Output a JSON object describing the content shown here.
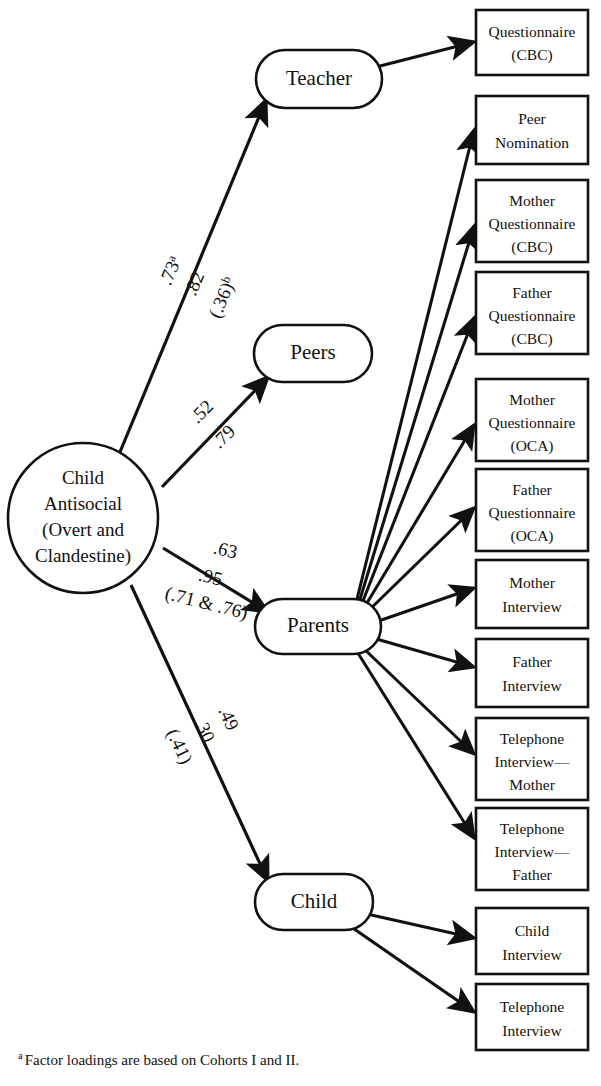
{
  "figure": {
    "latent_root": {
      "name": "child-antisocial",
      "lines": [
        "Child",
        "Antisocial",
        "(Overt and",
        "Clandestine)"
      ]
    },
    "latent_factors": [
      {
        "id": "teacher",
        "label": "Teacher"
      },
      {
        "id": "peers",
        "label": "Peers"
      },
      {
        "id": "parents",
        "label": "Parents"
      },
      {
        "id": "child",
        "label": "Child"
      }
    ],
    "paths": [
      {
        "id": "root-to-teacher",
        "from": "Child Antisocial (Overt and Clandestine)",
        "to": "Teacher",
        "coefficients": [
          "1.73",
          ".82",
          "(.36)"
        ],
        "labels": [
          {
            "text": ".73",
            "sup": "a"
          },
          {
            "text": ".82",
            "sup": ""
          },
          {
            "text": "(.36)",
            "sup": "b"
          }
        ]
      },
      {
        "id": "root-to-peers",
        "from": "Child Antisocial (Overt and Clandestine)",
        "to": "Peers",
        "labels": [
          {
            "text": ".52",
            "sup": ""
          },
          {
            "text": ".79",
            "sup": ""
          }
        ]
      },
      {
        "id": "root-to-parents",
        "from": "Child Antisocial (Overt and Clandestine)",
        "to": "Parents",
        "labels": [
          {
            "text": ".63",
            "sup": ""
          },
          {
            "text": ".95",
            "sup": ""
          },
          {
            "text": "(.71 & .76)",
            "sup": ""
          }
        ]
      },
      {
        "id": "root-to-child",
        "from": "Child Antisocial (Overt and Clandestine)",
        "to": "Child",
        "labels": [
          {
            "text": ".49",
            "sup": ""
          },
          {
            "text": ".30",
            "sup": ""
          },
          {
            "text": "(.41)",
            "sup": ""
          }
        ]
      }
    ],
    "indicators": [
      {
        "id": "ind-1",
        "source": "teacher",
        "lines": [
          "Questionnaire",
          "(CBC)"
        ]
      },
      {
        "id": "ind-2",
        "source": "parents",
        "lines": [
          "Peer",
          "Nomination"
        ]
      },
      {
        "id": "ind-3",
        "source": "parents",
        "lines": [
          "Mother",
          "Questionnaire",
          "(CBC)"
        ]
      },
      {
        "id": "ind-4",
        "source": "parents",
        "lines": [
          "Father",
          "Questionnaire",
          "(CBC)"
        ]
      },
      {
        "id": "ind-5",
        "source": "parents",
        "lines": [
          "Mother",
          "Questionnaire",
          "(OCA)"
        ]
      },
      {
        "id": "ind-6",
        "source": "parents",
        "lines": [
          "Father",
          "Questionnaire",
          "(OCA)"
        ]
      },
      {
        "id": "ind-7",
        "source": "parents",
        "lines": [
          "Mother",
          "Interview"
        ]
      },
      {
        "id": "ind-8",
        "source": "parents",
        "lines": [
          "Father",
          "Interview"
        ]
      },
      {
        "id": "ind-9",
        "source": "parents",
        "lines": [
          "Telephone",
          "Interview—",
          "Mother"
        ]
      },
      {
        "id": "ind-10",
        "source": "parents",
        "lines": [
          "Telephone",
          "Interview—",
          "Father"
        ]
      },
      {
        "id": "ind-11",
        "source": "child",
        "lines": [
          "Child",
          "Interview"
        ]
      },
      {
        "id": "ind-12",
        "source": "child",
        "lines": [
          "Telephone",
          "Interview"
        ]
      }
    ],
    "footnote": {
      "marker": "a",
      "text": "Factor loadings are based on Cohorts I and II."
    },
    "colors": {
      "stroke": "#111111",
      "fill": "#ffffff",
      "text": "#111111"
    }
  }
}
